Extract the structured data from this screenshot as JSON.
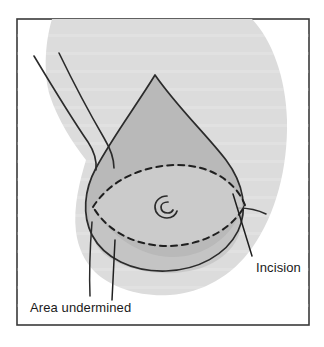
{
  "figure": {
    "domain": "Diagram",
    "frame": {
      "border_color": "#3a3a3a",
      "fill_color": "#ffffff"
    },
    "colors": {
      "torso_fill": "#dcdcdc",
      "breast_fill": "#b9b9b9",
      "lower_breast_fill": "#c8c8c8",
      "undermined_fill": "#cfcfcf",
      "outline": "#2b2b2b",
      "dashed_line": "#1f1f1f",
      "leader_line": "#1f1f1f",
      "text": "#1a1a1a"
    },
    "labels": [
      {
        "id": "incision",
        "text": "Incision",
        "x": 256,
        "y": 272,
        "anchor": "start"
      },
      {
        "id": "area-undermined",
        "text": "Area undermined",
        "x": 30,
        "y": 312,
        "anchor": "start"
      }
    ],
    "annotations": {
      "nipple": "spiral-nipple-marker",
      "incision_marking": "dashed-lens-ellipse",
      "undermined_region": "dashed-lens-ellipse"
    }
  }
}
